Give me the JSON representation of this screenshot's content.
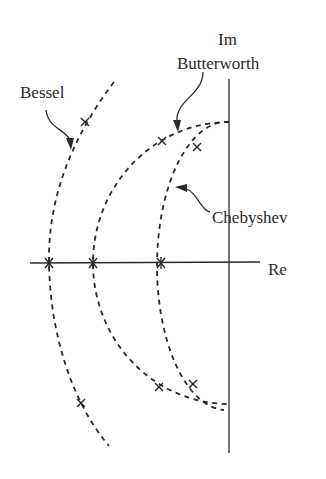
{
  "diagram": {
    "type": "s-plane pole locations",
    "axes": {
      "imaginary_label": "Im",
      "real_label": "Re"
    },
    "curves": [
      {
        "name": "Bessel",
        "label": "Bessel"
      },
      {
        "name": "Butterworth",
        "label": "Butterworth"
      },
      {
        "name": "Chebyshev",
        "label": "Chebyshev"
      }
    ],
    "poles": {
      "bessel": 3,
      "butterworth": 3,
      "chebyshev": 3
    }
  }
}
